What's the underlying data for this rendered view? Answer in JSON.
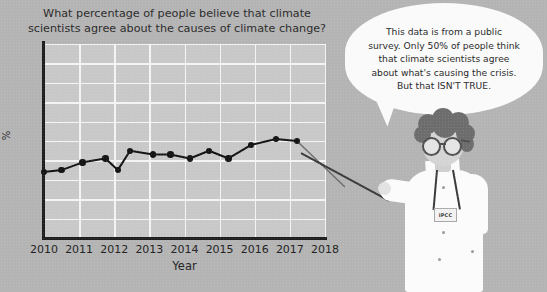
{
  "chart_data": {
    "type": "line",
    "title": "What percentage of people believe that climate scientists agree about the causes of climate change?",
    "title_line1": "What percentage of people believe that climate",
    "title_line2": "scientists agree about the causes of climate change?",
    "xlabel": "Year",
    "ylabel": "%",
    "xlim": [
      2010,
      2018
    ],
    "ylim": [
      0,
      100
    ],
    "xticks": [
      "2010",
      "2011",
      "2012",
      "2013",
      "2014",
      "2015",
      "2016",
      "2017",
      "2018"
    ],
    "yticks": [
      "100",
      "90",
      "80",
      "70",
      "60",
      "50",
      "40",
      "30",
      "20",
      "10"
    ],
    "grid": true,
    "legend": "none",
    "marker": "filled-circle",
    "line_color": "#141414",
    "x": [
      2010,
      2010.5,
      2011.1,
      2011.75,
      2012.1,
      2012.45,
      2013.1,
      2013.6,
      2014.15,
      2014.7,
      2015.25,
      2015.9,
      2016.6,
      2017.2
    ],
    "values": [
      34,
      35,
      39,
      41,
      35,
      45,
      43,
      43,
      41,
      45,
      41,
      48,
      51,
      50
    ]
  },
  "speech_bubble": {
    "line1": "This data is from a public",
    "line2": "survey. Only 50% of people think",
    "line3": "that climate scientists agree",
    "line4": "about what's causing the crisis.",
    "line5": "But that ISN'T TRUE."
  },
  "character": {
    "badge_label": "IPCC",
    "role": "scientist",
    "coat_color": "#fbfbfb",
    "hair_color": "#6d6d6d"
  },
  "colors": {
    "background": "#b4b4b4",
    "plot_area": "#c8c8c8",
    "gridline": "#f4f4f4",
    "axis": "#1e1e1e",
    "text": "#232323",
    "bubble": "#fafafa"
  }
}
